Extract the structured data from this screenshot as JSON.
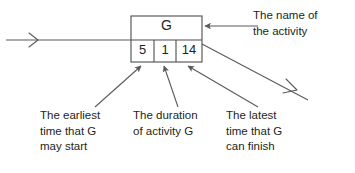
{
  "diagram": {
    "background_color": "#ffffff",
    "line_color": "#5a5a5a",
    "box_line_color": "#4d4d4d",
    "text_color": "#231f20",
    "node": {
      "activity_name": "G",
      "cells": [
        {
          "key": "earliest_start",
          "value": "5"
        },
        {
          "key": "duration",
          "value": "1"
        },
        {
          "key": "latest_finish",
          "value": "14"
        }
      ]
    },
    "annotations": [
      {
        "key": "name",
        "text": "The name of\nthe activity"
      },
      {
        "key": "earliest",
        "text": "The earliest\ntime that G\nmay start"
      },
      {
        "key": "duration",
        "text": "The duration\nof activity G"
      },
      {
        "key": "latest",
        "text": "The latest\ntime that G\ncan finish"
      }
    ]
  }
}
